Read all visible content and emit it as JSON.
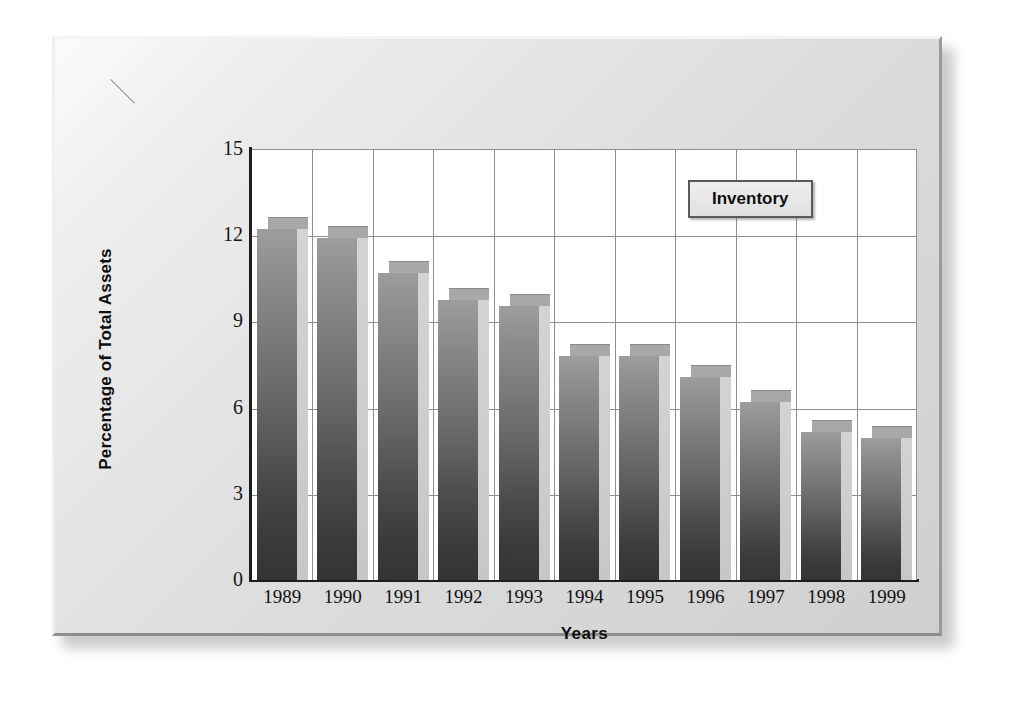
{
  "chart_data": {
    "type": "bar",
    "title": "",
    "subtitle": "",
    "xlabel": "Years",
    "ylabel": "Percentage of Total Assets",
    "categories": [
      "1989",
      "1990",
      "1991",
      "1992",
      "1993",
      "1994",
      "1995",
      "1996",
      "1997",
      "1998",
      "1999"
    ],
    "series": [
      {
        "name": "Inventory",
        "values": [
          12.2,
          11.9,
          10.7,
          9.75,
          9.55,
          7.8,
          7.8,
          7.05,
          6.2,
          5.15,
          4.95
        ]
      }
    ],
    "ylim": [
      0,
      15
    ],
    "yticks": [
      0,
      3,
      6,
      9,
      12,
      15
    ],
    "ytick_labels": [
      "0",
      "3",
      "6",
      "9",
      "12",
      "15"
    ],
    "grid": true,
    "grid_horizontal": true,
    "grid_vertical": true,
    "legend": {
      "position": "upper-right-inside",
      "entries": [
        "Inventory"
      ]
    },
    "style": "3d-bar",
    "colors": {
      "bar_front_top": "#9d9d9d",
      "bar_front_bottom": "#343434",
      "bar_side": "#cfcfcf",
      "bar_top_cap": "#a8a8a8",
      "plot_background": "#ffffff",
      "frame_background": "#dcdcdc",
      "grid_line": "#8f8f8f",
      "axis_line": "#1d1d1d",
      "text": "#111111"
    }
  },
  "legend": {
    "label": "Inventory"
  },
  "axes": {
    "y_title": "Percentage of Total Assets",
    "x_title": "Years"
  }
}
